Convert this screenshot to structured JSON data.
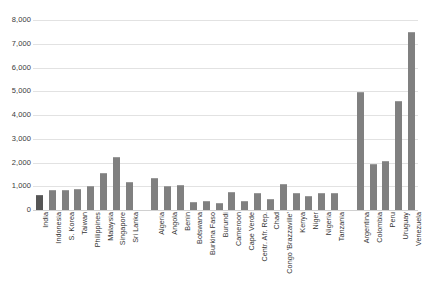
{
  "chart_data": {
    "type": "bar",
    "title": "",
    "subtitle": "",
    "xlabel": "",
    "ylabel": "",
    "ylim": [
      0,
      8000
    ],
    "ytick_values": [
      0,
      1000,
      2000,
      3000,
      4000,
      5000,
      6000,
      7000,
      8000
    ],
    "ytick_labels": [
      "0",
      "1,000",
      "2,000",
      "3,000",
      "4,000",
      "5,000",
      "6,000",
      "7,000",
      "8,000"
    ],
    "grid": true,
    "legend": "none",
    "bar_color": "#808080",
    "highlight_color": "#565656",
    "gridline_color": "#e2e2e2",
    "groups": [
      {
        "name": "Asia",
        "categories": [
          "India",
          "Indonesia",
          "S. Korea",
          "Taiwan",
          "Philippines",
          "Malaysia",
          "Singapore",
          "Sri Lanka"
        ],
        "values": [
          620,
          830,
          850,
          900,
          1000,
          1560,
          2230,
          1180
        ],
        "highlight": [
          "India"
        ]
      },
      {
        "name": "Africa",
        "categories": [
          "Algeria",
          "Angola",
          "Benin",
          "Botswana",
          "Burkina Faso",
          "Burundi",
          "Cameroon",
          "Cape Verde",
          "Centr. Afr. Rep.",
          "Chad",
          "Congo 'Brazzaville'",
          "Kenya",
          "Niger",
          "Nigeria",
          "Tanzania"
        ],
        "values": [
          1350,
          1000,
          1050,
          350,
          400,
          290,
          760,
          380,
          700,
          480,
          1100,
          700,
          600,
          700,
          700
        ],
        "highlight": []
      },
      {
        "name": "Latin America",
        "categories": [
          "Argentina",
          "Colombia",
          "Peru",
          "Uruguay",
          "Venezuela"
        ],
        "values": [
          4950,
          1950,
          2050,
          4600,
          7500
        ],
        "highlight": []
      }
    ]
  }
}
